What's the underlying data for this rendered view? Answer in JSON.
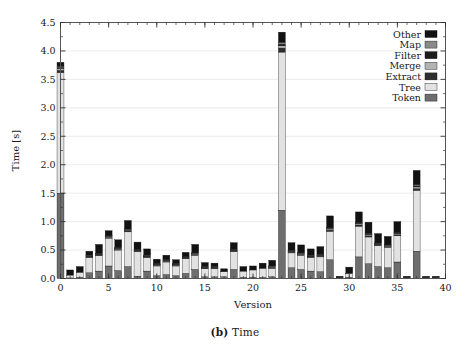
{
  "figure": {
    "caption_prefix": "(b)",
    "caption_text": "Time"
  },
  "chart_data": {
    "type": "bar",
    "stacked": true,
    "title": "",
    "subtitle": "",
    "xlabel": "Version",
    "ylabel": "Time [s]",
    "xlim": [
      0,
      40
    ],
    "ylim": [
      0.0,
      4.5
    ],
    "ytick_values": [
      0.0,
      0.5,
      1.0,
      1.5,
      2.0,
      2.5,
      3.0,
      3.5,
      4.0,
      4.5
    ],
    "ytick_labels": [
      "0.0",
      "0.5",
      "1.0",
      "1.5",
      "2.0",
      "2.5",
      "3.0",
      "3.5",
      "4.0",
      "4.5"
    ],
    "xtick_values": [
      0,
      5,
      10,
      15,
      20,
      25,
      30,
      35,
      40
    ],
    "xtick_labels": [
      "0",
      "5",
      "10",
      "15",
      "20",
      "25",
      "30",
      "35",
      "40"
    ],
    "x_minor_step": 1,
    "grid": true,
    "grid_axis": "y",
    "legend_position": "top-right",
    "legend_order": [
      "Other",
      "Map",
      "Filter",
      "Merge",
      "Extract",
      "Tree",
      "Token"
    ],
    "colors": {
      "Other": "#121212",
      "Map": "#8a8a8a",
      "Filter": "#1c1c1c",
      "Merge": "#b3b3b3",
      "Extract": "#2e2e2e",
      "Tree": "#e2e2e2",
      "Token": "#6e6e6e"
    },
    "categories": [
      0,
      1,
      2,
      3,
      4,
      5,
      6,
      7,
      8,
      9,
      10,
      11,
      12,
      13,
      14,
      15,
      16,
      17,
      18,
      19,
      20,
      21,
      22,
      23,
      24,
      25,
      26,
      27,
      28,
      29,
      30,
      31,
      32,
      33,
      34,
      35,
      36,
      37,
      38,
      39
    ],
    "stack_order_bottom_to_top": [
      "Token",
      "Tree",
      "Extract",
      "Merge",
      "Filter",
      "Map",
      "Other"
    ],
    "series": [
      {
        "name": "Token",
        "values": [
          1.5,
          0.01,
          0.02,
          0.1,
          0.13,
          0.22,
          0.14,
          0.21,
          0.04,
          0.13,
          0.05,
          0.07,
          0.05,
          0.09,
          0.16,
          0.03,
          0.03,
          0.03,
          0.16,
          0.02,
          0.02,
          0.02,
          0.03,
          1.2,
          0.19,
          0.16,
          0.13,
          0.12,
          0.33,
          0.01,
          0.02,
          0.38,
          0.26,
          0.21,
          0.19,
          0.29,
          0.01,
          0.48,
          0.01,
          0.01
        ]
      },
      {
        "name": "Tree",
        "values": [
          2.12,
          0.05,
          0.09,
          0.27,
          0.27,
          0.49,
          0.36,
          0.61,
          0.43,
          0.24,
          0.17,
          0.22,
          0.17,
          0.26,
          0.25,
          0.14,
          0.14,
          0.09,
          0.31,
          0.11,
          0.13,
          0.16,
          0.15,
          2.78,
          0.26,
          0.25,
          0.24,
          0.26,
          0.5,
          0.01,
          0.07,
          0.54,
          0.47,
          0.37,
          0.36,
          0.46,
          0.01,
          1.07,
          0.01,
          0.01
        ]
      },
      {
        "name": "Extract",
        "values": [
          0.04,
          0.0,
          0.0,
          0.01,
          0.01,
          0.01,
          0.01,
          0.02,
          0.01,
          0.01,
          0.01,
          0.01,
          0.01,
          0.01,
          0.01,
          0.01,
          0.01,
          0.0,
          0.01,
          0.0,
          0.0,
          0.0,
          0.01,
          0.07,
          0.01,
          0.01,
          0.01,
          0.01,
          0.02,
          0.0,
          0.0,
          0.02,
          0.02,
          0.01,
          0.01,
          0.02,
          0.0,
          0.03,
          0.0,
          0.0
        ]
      },
      {
        "name": "Merge",
        "values": [
          0.03,
          0.0,
          0.0,
          0.01,
          0.01,
          0.01,
          0.01,
          0.01,
          0.01,
          0.01,
          0.01,
          0.01,
          0.01,
          0.01,
          0.01,
          0.01,
          0.01,
          0.0,
          0.01,
          0.0,
          0.0,
          0.0,
          0.01,
          0.04,
          0.01,
          0.01,
          0.01,
          0.01,
          0.02,
          0.0,
          0.0,
          0.02,
          0.02,
          0.01,
          0.01,
          0.02,
          0.0,
          0.03,
          0.0,
          0.0
        ]
      },
      {
        "name": "Filter",
        "values": [
          0.02,
          0.0,
          0.0,
          0.01,
          0.01,
          0.01,
          0.01,
          0.01,
          0.01,
          0.01,
          0.01,
          0.01,
          0.01,
          0.01,
          0.01,
          0.01,
          0.01,
          0.0,
          0.01,
          0.0,
          0.0,
          0.0,
          0.01,
          0.03,
          0.01,
          0.01,
          0.01,
          0.01,
          0.01,
          0.0,
          0.0,
          0.01,
          0.01,
          0.01,
          0.01,
          0.01,
          0.0,
          0.02,
          0.0,
          0.0
        ]
      },
      {
        "name": "Map",
        "values": [
          0.02,
          0.0,
          0.0,
          0.01,
          0.01,
          0.01,
          0.01,
          0.01,
          0.01,
          0.01,
          0.01,
          0.01,
          0.01,
          0.01,
          0.01,
          0.01,
          0.01,
          0.0,
          0.01,
          0.0,
          0.0,
          0.0,
          0.01,
          0.03,
          0.01,
          0.01,
          0.01,
          0.01,
          0.01,
          0.0,
          0.0,
          0.01,
          0.01,
          0.01,
          0.01,
          0.01,
          0.0,
          0.02,
          0.0,
          0.0
        ]
      },
      {
        "name": "Other",
        "values": [
          0.07,
          0.09,
          0.1,
          0.07,
          0.16,
          0.09,
          0.14,
          0.15,
          0.13,
          0.11,
          0.08,
          0.08,
          0.07,
          0.07,
          0.15,
          0.07,
          0.06,
          0.05,
          0.12,
          0.08,
          0.07,
          0.09,
          0.1,
          0.18,
          0.14,
          0.14,
          0.11,
          0.14,
          0.21,
          0.02,
          0.11,
          0.19,
          0.2,
          0.17,
          0.15,
          0.19,
          0.02,
          0.25,
          0.02,
          0.02
        ]
      }
    ],
    "totals": [
      3.8,
      0.15,
      0.21,
      0.48,
      0.6,
      0.84,
      0.68,
      1.02,
      0.64,
      0.52,
      0.33,
      0.41,
      0.33,
      0.46,
      0.6,
      0.27,
      0.27,
      0.17,
      0.63,
      0.21,
      0.22,
      0.27,
      0.32,
      4.33,
      0.63,
      0.59,
      0.52,
      0.56,
      1.1,
      0.04,
      0.2,
      1.17,
      0.99,
      0.79,
      0.74,
      1.0,
      0.04,
      1.9,
      0.04,
      0.04
    ]
  }
}
